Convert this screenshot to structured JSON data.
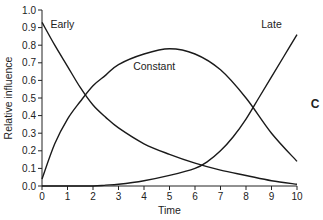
{
  "chart_data": {
    "type": "line",
    "title": "",
    "xlabel": "Time",
    "ylabel": "Relative influence",
    "panel_label": "C",
    "xlim": [
      0,
      10
    ],
    "ylim": [
      0,
      1.0
    ],
    "xticks": [
      "0",
      "1",
      "2",
      "3",
      "4",
      "5",
      "6",
      "7",
      "8",
      "9",
      "10"
    ],
    "yticks": [
      "0.0",
      "0.1",
      "0.2",
      "0.3",
      "0.4",
      "0.5",
      "0.6",
      "0.7",
      "0.8",
      "0.9",
      "1.0"
    ],
    "grid": false,
    "series": [
      {
        "name": "Early",
        "x": [
          0,
          0.5,
          1,
          1.5,
          2,
          2.5,
          3,
          4,
          5,
          6,
          7,
          8,
          9,
          10
        ],
        "values": [
          0.93,
          0.8,
          0.68,
          0.56,
          0.46,
          0.39,
          0.33,
          0.24,
          0.18,
          0.13,
          0.09,
          0.06,
          0.03,
          0.01
        ]
      },
      {
        "name": "Constant",
        "x": [
          0,
          0.5,
          1,
          1.5,
          2,
          2.5,
          3,
          4,
          5,
          6,
          7,
          8,
          9,
          10
        ],
        "values": [
          0.04,
          0.24,
          0.38,
          0.48,
          0.57,
          0.63,
          0.69,
          0.75,
          0.78,
          0.75,
          0.66,
          0.5,
          0.3,
          0.14
        ]
      },
      {
        "name": "Late",
        "x": [
          0,
          1,
          2,
          2.5,
          3,
          4,
          5,
          6,
          6.5,
          7,
          7.5,
          8,
          8.5,
          9,
          9.5,
          10
        ],
        "values": [
          0,
          0,
          0,
          0.005,
          0.01,
          0.03,
          0.06,
          0.1,
          0.14,
          0.2,
          0.28,
          0.38,
          0.5,
          0.62,
          0.74,
          0.86
        ]
      }
    ],
    "annotations": [
      {
        "text": "Early",
        "x": 0.8,
        "y": 0.9
      },
      {
        "text": "Constant",
        "x": 4.4,
        "y": 0.66
      },
      {
        "text": "Late",
        "x": 9.0,
        "y": 0.9
      }
    ]
  }
}
